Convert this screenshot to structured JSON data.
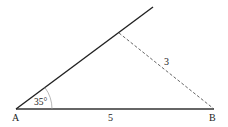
{
  "diagram": {
    "type": "triangle-construction",
    "points": {
      "A": {
        "label": "A",
        "x": 16,
        "y": 109
      },
      "B": {
        "label": "B",
        "x": 214,
        "y": 109
      },
      "ray_end": {
        "x": 153,
        "y": 7
      },
      "C": {
        "x": 119,
        "y": 33
      }
    },
    "labels": {
      "vertex_a": "A",
      "vertex_b": "B",
      "side_ab": "5",
      "side_bc": "3",
      "angle_a": "35°"
    },
    "colors": {
      "solid_line": "#222222",
      "dashed_line": "#555555",
      "arc": "#999999",
      "text": "#222222"
    }
  }
}
